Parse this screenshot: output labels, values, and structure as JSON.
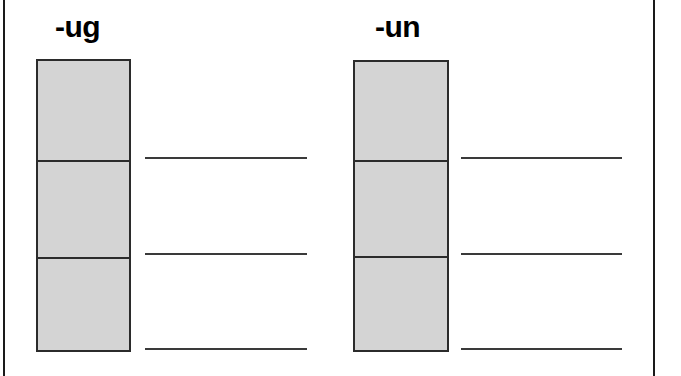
{
  "worksheet": {
    "width": 681,
    "height": 376,
    "background_color": "#ffffff",
    "border_color": "#1a1a1a",
    "box_fill_color": "#d4d4d4",
    "box_stroke_color": "#2b2b2b",
    "line_color": "#3a3a3a"
  },
  "groups": [
    {
      "label": "-ug",
      "label_left": 55,
      "label_top": 12,
      "box": {
        "left": 36,
        "top": 59,
        "width": 95,
        "height": 293
      },
      "dividers": [
        99,
        196
      ],
      "lines": [
        {
          "left": 145,
          "top": 157,
          "width": 162
        },
        {
          "left": 145,
          "top": 253,
          "width": 162
        },
        {
          "left": 145,
          "top": 348,
          "width": 162
        }
      ]
    },
    {
      "label": "-un",
      "label_left": 375,
      "label_top": 12,
      "box": {
        "left": 353,
        "top": 60,
        "width": 96,
        "height": 292
      },
      "dividers": [
        98,
        194
      ],
      "lines": [
        {
          "left": 461,
          "top": 157,
          "width": 161
        },
        {
          "left": 461,
          "top": 253,
          "width": 161
        },
        {
          "left": 461,
          "top": 348,
          "width": 161
        }
      ]
    }
  ]
}
